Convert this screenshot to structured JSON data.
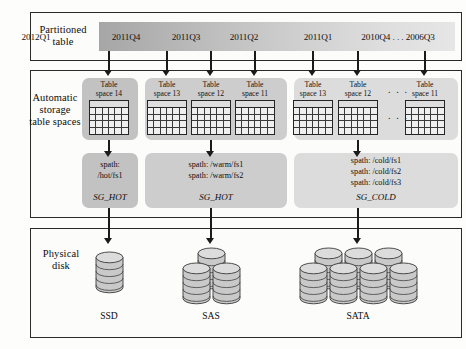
{
  "diagram": {
    "rows": [
      {
        "label": "Partitioned\ntable",
        "name": "partitioned-table"
      },
      {
        "label": "Automatic\nstorage\ntable spaces",
        "name": "automatic-storage-table-spaces"
      },
      {
        "label": "Physical\ndisk",
        "name": "physical-disk"
      }
    ]
  },
  "partitions": {
    "labels": [
      "2012Q1",
      "2011Q4",
      "2011Q3",
      "2011Q2",
      "2011Q1",
      "2010Q4 . . . 2006Q3"
    ],
    "gradient_colors": [
      "#a6a6a6",
      "#b5b5b5",
      "#c4c4c4",
      "#d2d2d2",
      "#dedede",
      "#e6e6e6"
    ]
  },
  "tablespace_groups": [
    {
      "panel_shade": "dark",
      "tablespaces": [
        {
          "line1": "Table",
          "line2": "space 14"
        }
      ],
      "ellipsis": ""
    },
    {
      "panel_shade": "mid",
      "tablespaces": [
        {
          "line1": "Table",
          "line2": "space 13"
        },
        {
          "line1": "Table",
          "line2": "space 12"
        },
        {
          "line1": "Table",
          "line2": "space 11"
        }
      ],
      "ellipsis": ""
    },
    {
      "panel_shade": "light",
      "tablespaces": [
        {
          "line1": "Table",
          "line2": "space 13"
        },
        {
          "line1": "Table",
          "line2": "space 12"
        },
        {
          "line1": "Table",
          "line2": "space 11"
        }
      ],
      "ellipsis": ". . ."
    }
  ],
  "storage_groups": [
    {
      "panel_shade": "dark",
      "paths": [
        "spath:",
        "/hot/fs1"
      ],
      "name": "SG_HOT"
    },
    {
      "panel_shade": "mid",
      "paths": [
        "spath: /warm/fs1",
        "spath: /warm/fs2"
      ],
      "name": "SG_HOT"
    },
    {
      "panel_shade": "light",
      "paths": [
        "spath: /cold/fs1",
        "spath: /cold/fs2",
        "spath: /cold/fs3"
      ],
      "name": "SG_COLD"
    }
  ],
  "disks": [
    {
      "label": "SSD",
      "top_count": 0,
      "bottom_count": 1
    },
    {
      "label": "SAS",
      "top_count": 1,
      "bottom_count": 2
    },
    {
      "label": "SATA",
      "top_count": 3,
      "bottom_count": 4
    }
  ],
  "colors": {
    "frame_border": "#2a2a2a",
    "arrow": "#1b1b1b",
    "disk_body": "#c9c9c9",
    "disk_top": "#dcdcdc",
    "disk_edge": "#3a3a3a"
  }
}
